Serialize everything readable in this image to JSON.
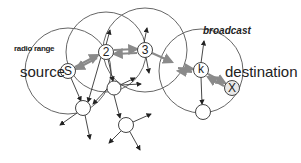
{
  "diagram": {
    "labels": {
      "radio_range": "radio range",
      "source": "source",
      "broadcast": "broadcast",
      "destination": "destination"
    },
    "nodes": [
      {
        "id": "S",
        "label": "S",
        "x": 68,
        "y": 71
      },
      {
        "id": "2",
        "label": "2",
        "x": 106,
        "y": 52
      },
      {
        "id": "3",
        "label": "3",
        "x": 145,
        "y": 50
      },
      {
        "id": "k",
        "label": "k",
        "x": 201,
        "y": 70
      },
      {
        "id": "X",
        "label": "X",
        "x": 232,
        "y": 88
      },
      {
        "id": "n1",
        "label": "",
        "x": 83,
        "y": 108
      },
      {
        "id": "n2",
        "label": "",
        "x": 114,
        "y": 88
      },
      {
        "id": "n3",
        "label": "",
        "x": 126,
        "y": 125
      },
      {
        "id": "n4",
        "label": "",
        "x": 203,
        "y": 112
      }
    ],
    "path": [
      "S",
      "2",
      "3",
      "k",
      "X"
    ],
    "colors": {
      "stroke": "#555555",
      "path_arrow": "#8a8a8a",
      "text": "#222222"
    }
  }
}
